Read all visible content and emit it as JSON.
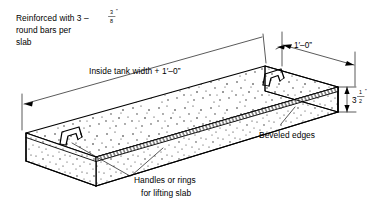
{
  "drawing": {
    "title": "Precast concrete slab isometric detail",
    "line_color": "#000000",
    "background_color": "#ffffff"
  },
  "annotations": {
    "reinforcement": {
      "name": "reinforcement-note",
      "line1_pre": "Reinforced with 3 – ",
      "fraction_numerator": "3",
      "fraction_denominator": "8",
      "inch_mark": "”",
      "line2": "round bars per",
      "line3": "slab"
    },
    "width_label": {
      "name": "inside-tank-width-label",
      "text": "Inside tank width + 1′–0”"
    },
    "beveled_edges": {
      "name": "beveled-edges-label",
      "text": "Beveled edges"
    },
    "handles": {
      "name": "handles-label",
      "line1": "Handles or rings",
      "line2": "for lifting slab"
    }
  },
  "dimensions": {
    "overhang": {
      "name": "overhang-dimension",
      "text": "1′–0”"
    },
    "thickness": {
      "name": "slab-thickness-dimension",
      "whole": "3",
      "fraction_numerator": "1",
      "fraction_denominator": "2",
      "inch_mark": "”"
    }
  },
  "parts": [
    {
      "name": "slab-top-face",
      "label": "Top face of slab"
    },
    {
      "name": "slab-front-face",
      "label": "Front long face"
    },
    {
      "name": "slab-left-end-face",
      "label": "Left end face"
    },
    {
      "name": "slab-right-end-face",
      "label": "Right end face"
    },
    {
      "name": "beveled-edge-strip",
      "label": "Beveled edge strip"
    },
    {
      "name": "handle-loop-left",
      "label": "Left lifting handle"
    },
    {
      "name": "handle-loop-right",
      "label": "Right lifting handle"
    }
  ]
}
